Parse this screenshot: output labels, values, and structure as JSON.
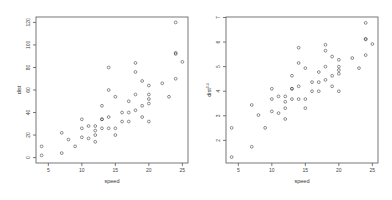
{
  "chart_data": [
    {
      "type": "scatter",
      "title": "",
      "xlabel": "speed",
      "ylabel": "dist",
      "xlim": [
        4,
        25
      ],
      "ylim": [
        0,
        120
      ],
      "xticks": [
        5,
        10,
        15,
        20,
        25
      ],
      "yticks": [
        0,
        20,
        40,
        60,
        80,
        100,
        120
      ],
      "grid": false,
      "legend": null,
      "frame": {
        "left": 36,
        "top": 17,
        "right": 188,
        "bottom": 163
      },
      "x": [
        4,
        4,
        7,
        7,
        8,
        9,
        10,
        10,
        10,
        11,
        11,
        12,
        12,
        12,
        12,
        13,
        13,
        13,
        13,
        14,
        14,
        14,
        14,
        15,
        15,
        15,
        16,
        16,
        17,
        17,
        17,
        18,
        18,
        18,
        18,
        19,
        19,
        19,
        20,
        20,
        20,
        20,
        20,
        22,
        23,
        24,
        24,
        24,
        24,
        25
      ],
      "y": [
        2,
        10,
        4,
        22,
        16,
        10,
        18,
        26,
        34,
        17,
        28,
        14,
        20,
        24,
        28,
        26,
        34,
        34,
        46,
        26,
        36,
        60,
        80,
        20,
        26,
        54,
        32,
        40,
        32,
        40,
        50,
        42,
        56,
        76,
        84,
        36,
        46,
        68,
        32,
        48,
        52,
        56,
        64,
        66,
        54,
        70,
        92,
        93,
        120,
        85
      ]
    },
    {
      "type": "scatter",
      "title": "",
      "xlabel": "speed",
      "ylabel": "dist^0.4",
      "xlim": [
        4,
        25
      ],
      "ylim": [
        1.3,
        6.8
      ],
      "xticks": [
        5,
        10,
        15,
        20,
        25
      ],
      "yticks": [
        2,
        3,
        4,
        5,
        6,
        7
      ],
      "grid": false,
      "legend": null,
      "frame": {
        "left": 226,
        "top": 17,
        "right": 378,
        "bottom": 163
      },
      "x": [
        4,
        4,
        7,
        7,
        8,
        9,
        10,
        10,
        10,
        11,
        11,
        12,
        12,
        12,
        12,
        13,
        13,
        13,
        13,
        14,
        14,
        14,
        14,
        15,
        15,
        15,
        16,
        16,
        17,
        17,
        17,
        18,
        18,
        18,
        18,
        19,
        19,
        19,
        20,
        20,
        20,
        20,
        20,
        22,
        23,
        24,
        24,
        24,
        24,
        25
      ],
      "y": [
        1.32,
        2.51,
        1.74,
        3.44,
        3.03,
        2.51,
        3.18,
        3.68,
        4.1,
        3.11,
        3.79,
        2.87,
        3.31,
        3.57,
        3.79,
        3.68,
        4.1,
        4.1,
        4.63,
        3.68,
        4.2,
        5.15,
        5.77,
        3.31,
        3.68,
        4.94,
        4.0,
        4.37,
        4.0,
        4.37,
        4.78,
        4.46,
        5.0,
        5.65,
        5.89,
        4.2,
        4.63,
        5.41,
        4.0,
        4.71,
        4.86,
        5.0,
        5.28,
        5.35,
        4.94,
        5.47,
        6.11,
        6.13,
        6.78,
        5.92
      ]
    }
  ]
}
